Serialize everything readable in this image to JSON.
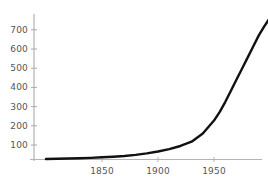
{
  "chart_data": {
    "type": "line",
    "title": "",
    "subtitle": "",
    "xlabel": "",
    "ylabel": "",
    "xlim": [
      1800,
      2000
    ],
    "ylim": [
      0,
      780
    ],
    "grid": false,
    "legend": null,
    "xticks": [
      1850,
      1900,
      1950
    ],
    "xticklabels": [
      "1850",
      "1900",
      "1950"
    ],
    "yticks": [
      100,
      200,
      300,
      400,
      500,
      600,
      700
    ],
    "yticklabels": [
      "100",
      "200",
      "300",
      "400",
      "500",
      "600",
      "700"
    ],
    "series": [
      {
        "name": "curve",
        "color": "#111111",
        "x": [
          1800,
          1810,
          1820,
          1830,
          1840,
          1850,
          1860,
          1870,
          1880,
          1890,
          1900,
          1910,
          1920,
          1930,
          1940,
          1950,
          1955,
          1960,
          1965,
          1970,
          1975,
          1980,
          1985,
          1990,
          1995,
          2000
        ],
        "y": [
          3,
          4,
          5,
          7,
          9,
          12,
          15,
          19,
          25,
          33,
          43,
          56,
          73,
          96,
          140,
          210,
          256,
          310,
          370,
          430,
          490,
          550,
          610,
          670,
          720,
          765
        ]
      }
    ],
    "axis_color": "#aaaaaa",
    "tick_label_color": "#555555",
    "background": "#ffffff"
  },
  "axes": {
    "y_axis_name": "y-axis",
    "x_axis_name": "x-axis"
  }
}
